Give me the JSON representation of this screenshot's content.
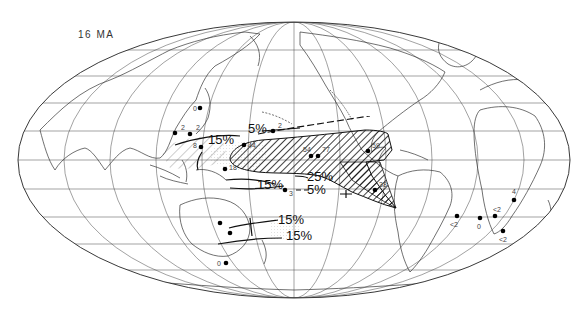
{
  "map": {
    "title": "16 MA",
    "projection": "Mollweide (Pacific-centered)",
    "contours": [
      {
        "label": "5%",
        "x": 248,
        "y": 133
      },
      {
        "label": "15%",
        "x": 208,
        "y": 139
      },
      {
        "label": "25%",
        "x": 307,
        "y": 179
      },
      {
        "label": "15%",
        "x": 257,
        "y": 185
      },
      {
        "label": "5%",
        "x": 307,
        "y": 193
      },
      {
        "label": "15%",
        "x": 278,
        "y": 220
      },
      {
        "label": "15%",
        "x": 286,
        "y": 239
      }
    ],
    "sites": [
      {
        "label": "0",
        "x": 200,
        "y": 108,
        "lx": 193,
        "ly": 111
      },
      {
        "label": "2",
        "x": 175,
        "y": 133,
        "lx": 181,
        "ly": 130
      },
      {
        "label": "2",
        "x": 190,
        "y": 134,
        "lx": 196,
        "ly": 130
      },
      {
        "label": "2",
        "x": 273,
        "y": 131,
        "lx": 278,
        "ly": 128
      },
      {
        "label": "8",
        "x": 201,
        "y": 147,
        "lx": 193,
        "ly": 148
      },
      {
        "label": "44",
        "x": 244,
        "y": 145,
        "lx": 248,
        "ly": 148
      },
      {
        "label": "18",
        "x": 225,
        "y": 169,
        "lx": 229,
        "ly": 170
      },
      {
        "label": "54",
        "x": 311,
        "y": 156,
        "lx": 303,
        "ly": 152
      },
      {
        "label": "77",
        "x": 318,
        "y": 156,
        "lx": 322,
        "ly": 152
      },
      {
        "label": "59",
        "x": 368,
        "y": 151,
        "lx": 372,
        "ly": 148
      },
      {
        "label": "3",
        "x": 285,
        "y": 190,
        "lx": 289,
        "ly": 196
      },
      {
        "label": "38",
        "x": 375,
        "y": 190,
        "lx": 379,
        "ly": 187
      },
      {
        "label": "",
        "x": 220,
        "y": 223,
        "lx": 220,
        "ly": 223
      },
      {
        "label": "",
        "x": 230,
        "y": 233,
        "lx": 230,
        "ly": 233
      },
      {
        "label": "0",
        "x": 226,
        "y": 263,
        "lx": 217,
        "ly": 266
      },
      {
        "label": "<2",
        "x": 457,
        "y": 216,
        "lx": 450,
        "ly": 227
      },
      {
        "label": "0",
        "x": 480,
        "y": 218,
        "lx": 477,
        "ly": 229
      },
      {
        "label": "<2",
        "x": 495,
        "y": 216,
        "lx": 493,
        "ly": 212
      },
      {
        "label": "4",
        "x": 514,
        "y": 200,
        "lx": 512,
        "ly": 194
      },
      {
        "label": "<2",
        "x": 503,
        "y": 231,
        "lx": 499,
        "ly": 242
      }
    ]
  }
}
